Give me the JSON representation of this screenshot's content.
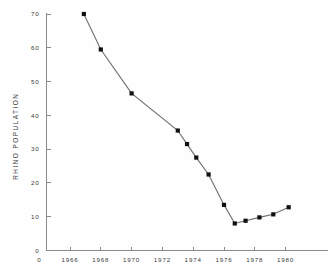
{
  "chart_data": {
    "type": "line",
    "title": "",
    "subtitle": "",
    "xlabel": "",
    "ylabel": "RHINO POPULATION",
    "xlim": [
      1965.0,
      1981.0
    ],
    "ylim": [
      0,
      70
    ],
    "grid": false,
    "legend": null,
    "x_tick_labels": [
      "1966",
      "1968",
      "1970",
      "1972",
      "1974",
      "1976",
      "1978",
      "1980"
    ],
    "x_ticks": [
      1966,
      1968,
      1970,
      1972,
      1974,
      1976,
      1978,
      1980
    ],
    "y_tick_labels": [
      "0",
      "10",
      "20",
      "30",
      "40",
      "50",
      "60",
      "70"
    ],
    "y_ticks": [
      0,
      10,
      20,
      30,
      40,
      50,
      60,
      70
    ],
    "origin_label": "0",
    "marker": "square",
    "series": [
      {
        "name": "Rhino population",
        "x": [
          1966.9,
          1968.0,
          1970.0,
          1973.0,
          1973.6,
          1974.2,
          1975.0,
          1976.0,
          1976.7,
          1977.4,
          1978.3,
          1979.2,
          1980.2
        ],
        "values": [
          70.0,
          59.5,
          46.5,
          35.5,
          31.5,
          27.5,
          22.5,
          13.5,
          8.0,
          8.8,
          9.8,
          10.7,
          12.8
        ]
      }
    ],
    "colors": {
      "line": "#6e6e6e",
      "marker": "#111111",
      "axis": "#8a8a8a",
      "text": "#3a3a3a",
      "background": "#fefefe"
    }
  }
}
